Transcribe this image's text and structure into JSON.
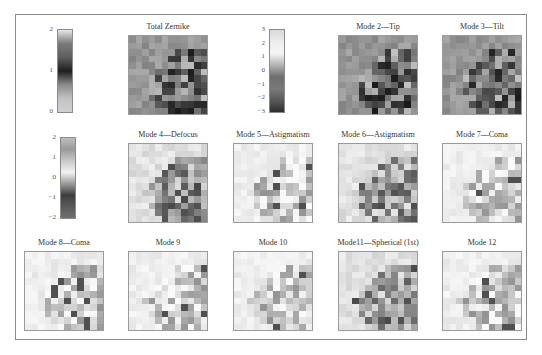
{
  "figure": {
    "colorbars": [
      {
        "id": "cb1",
        "ticks": [
          "2",
          "1",
          "0"
        ],
        "left": 57,
        "top": 29,
        "height": 84,
        "gradient": [
          "#e6e6e6",
          "#7a7a7a",
          "#5e5e5e",
          "#1e1e1e",
          "#8a8a8a",
          "#c2c2c2",
          "#d0d0d0"
        ]
      },
      {
        "id": "cb2",
        "ticks": [
          "3",
          "2",
          "1",
          "0",
          "−1",
          "−2",
          "−3"
        ],
        "left": 269,
        "top": 29,
        "height": 84,
        "gradient": [
          "#d8d8d8",
          "#ededed",
          "#f4f4f4",
          "#b4b4b4",
          "#6e6e6e",
          "#7a7a7a",
          "#5a5a5a",
          "#2e2e2e"
        ]
      },
      {
        "id": "cb3",
        "ticks": [
          "2",
          "1",
          "0",
          "−1",
          "−2"
        ],
        "left": 60,
        "top": 137,
        "height": 82,
        "gradient": [
          "#bdbdbd",
          "#9a9a9a",
          "#c8c8c8",
          "#f2f2f2",
          "#9a9a9a",
          "#3e3e3e",
          "#5a5a5a",
          "#707070"
        ]
      }
    ],
    "panels": [
      {
        "title": "Total Zernike",
        "left": 128,
        "top": 35,
        "style": "dark",
        "seed": 3
      },
      {
        "title": "Mode 2—Tip",
        "left": 338,
        "top": 35,
        "style": "dark",
        "seed": 7
      },
      {
        "title": "Mode 3—Tilt",
        "left": 442,
        "top": 35,
        "style": "dark",
        "seed": 11
      },
      {
        "title": "Mode 4—Defocus",
        "left": 128,
        "top": 143,
        "style": "mid",
        "seed": 13
      },
      {
        "title": "Mode 5—Astigmatism",
        "left": 233,
        "top": 143,
        "style": "light",
        "seed": 17
      },
      {
        "title": "Mode 6—Astigmatism",
        "left": 338,
        "top": 143,
        "style": "mid",
        "seed": 19
      },
      {
        "title": "Mode 7—Coma",
        "left": 442,
        "top": 143,
        "style": "light",
        "seed": 23
      },
      {
        "title": "Mode 8—Coma",
        "left": 24,
        "top": 251,
        "style": "light",
        "seed": 29
      },
      {
        "title": "Mode 9",
        "left": 128,
        "top": 251,
        "style": "light",
        "seed": 31
      },
      {
        "title": "Mode 10",
        "left": 233,
        "top": 251,
        "style": "light",
        "seed": 37
      },
      {
        "title": "Mode11—Spherical (1st)",
        "left": 338,
        "top": 251,
        "style": "mid",
        "seed": 41
      },
      {
        "title": "Mode 12",
        "left": 442,
        "top": 251,
        "style": "light",
        "seed": 43
      }
    ]
  }
}
